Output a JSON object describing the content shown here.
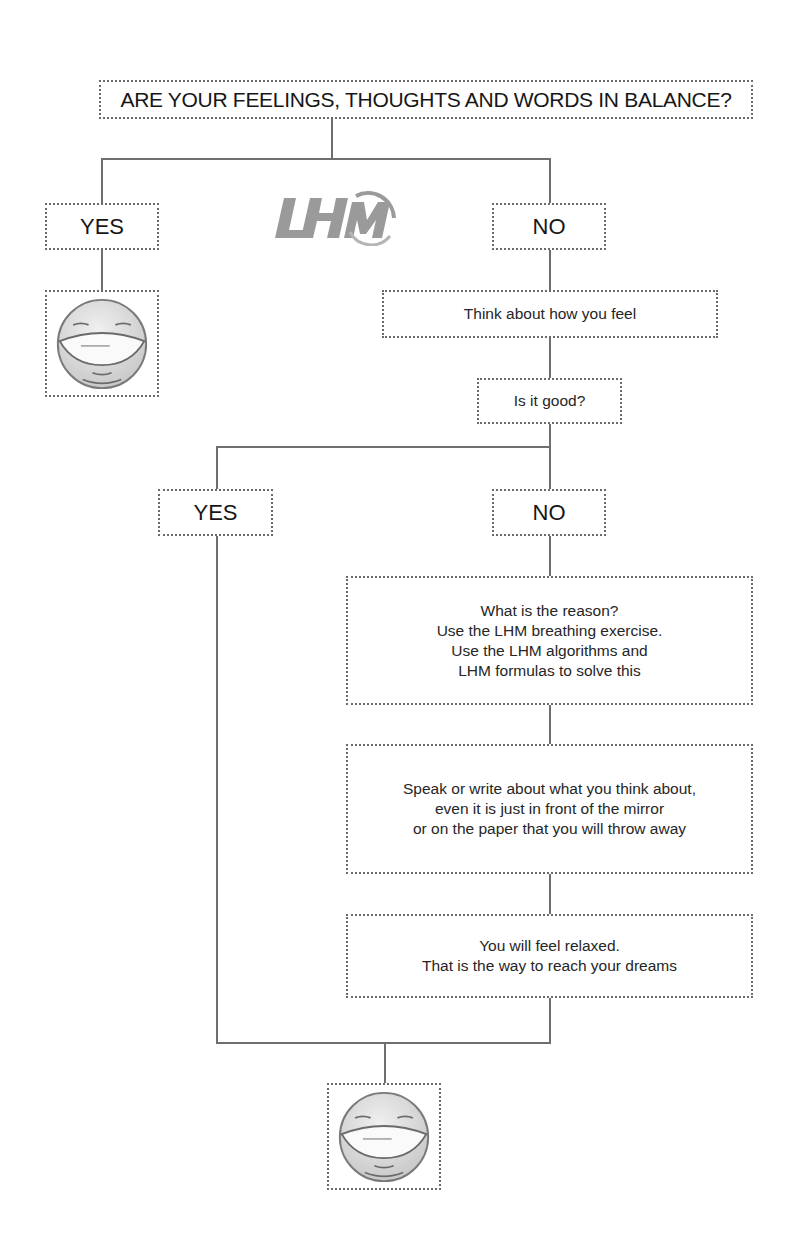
{
  "title": "ARE YOUR FEELINGS, THOUGHTS AND WORDS IN BALANCE?",
  "logo": {
    "text": "LHM",
    "color": "#9a9a9a"
  },
  "branch1": {
    "yes_label": "YES",
    "yes_result_icon": "laughing-face-icon",
    "no_label": "NO"
  },
  "steps": {
    "think": "Think about how you feel",
    "question": "Is it good?"
  },
  "branch2": {
    "yes_label": "YES",
    "no_label": "NO"
  },
  "reason_box": {
    "lines": [
      "What is the reason?",
      "Use the LHM breathing exercise.",
      "Use the LHM algorithms and",
      "LHM formulas to solve this"
    ]
  },
  "speak_box": {
    "lines": [
      "Speak or write about what you think about,",
      "even it is just in front of the mirror",
      "or on the paper that you will throw away"
    ]
  },
  "relaxed_box": {
    "lines": [
      "You will feel relaxed.",
      "That is the way to reach your dreams"
    ]
  },
  "final_result_icon": "laughing-face-icon",
  "colors": {
    "line": "#6e6e6e",
    "border": "#6a6a6a",
    "face_fill": "#d9d9d9",
    "face_stroke": "#7a7a7a"
  }
}
